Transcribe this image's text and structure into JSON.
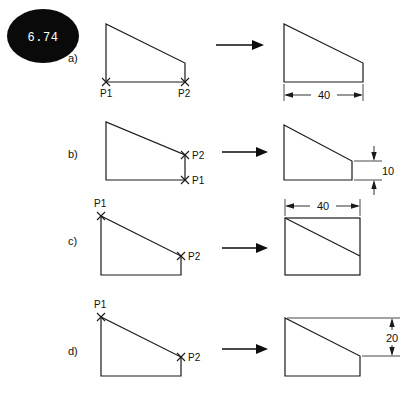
{
  "figure": {
    "badge": {
      "label": "6.74",
      "shape": "ellipse",
      "fill": "#0a0a0a",
      "text_color": "#ffffff"
    },
    "stroke_color": "#1a1a1a",
    "background": "#ffffff",
    "rows": [
      {
        "id": "a",
        "label": "a)",
        "before": {
          "description": "right trapezoid, tall left edge, short right edge, slope from top-left down to right",
          "point_labels": [
            "P1",
            "P2"
          ],
          "p1_position": "bottom-left",
          "p2_position": "bottom-right"
        },
        "after": {
          "description": "same trapezoid with horizontal width dimension below",
          "dimensions": [
            {
              "value": "40",
              "orientation": "horizontal",
              "placement": "below"
            }
          ]
        }
      },
      {
        "id": "b",
        "label": "b)",
        "before": {
          "description": "right trapezoid, tall left edge, short right edge",
          "point_labels": [
            "P2",
            "P1"
          ],
          "p1_position": "bottom-right",
          "p2_position": "top-of-right-edge"
        },
        "after": {
          "description": "same trapezoid with vertical right-edge dimension",
          "dimensions": [
            {
              "value": "10",
              "orientation": "vertical",
              "placement": "right"
            }
          ]
        }
      },
      {
        "id": "c",
        "label": "c)",
        "before": {
          "description": "right trapezoid with slope line, P1 at top-left corner, P2 at lower right end of slope",
          "point_labels": [
            "P1",
            "P2"
          ],
          "p1_position": "top-left",
          "p2_position": "right-end-of-slope"
        },
        "after": {
          "description": "full rectangle with internal diagonal slope, width dimension above",
          "dimensions": [
            {
              "value": "40",
              "orientation": "horizontal",
              "placement": "above"
            }
          ]
        }
      },
      {
        "id": "d",
        "label": "d)",
        "before": {
          "description": "right trapezoid with slope line, P1 at top-left corner, P2 at lower right end of slope",
          "point_labels": [
            "P1",
            "P2"
          ],
          "p1_position": "top-left",
          "p2_position": "right-end-of-slope"
        },
        "after": {
          "description": "rectangle with top-right corner cut by diagonal, vertical dimension at right",
          "dimensions": [
            {
              "value": "20",
              "orientation": "vertical",
              "placement": "right"
            }
          ]
        }
      }
    ],
    "transform_arrow": {
      "name": "right-arrow",
      "direction": "right"
    }
  }
}
